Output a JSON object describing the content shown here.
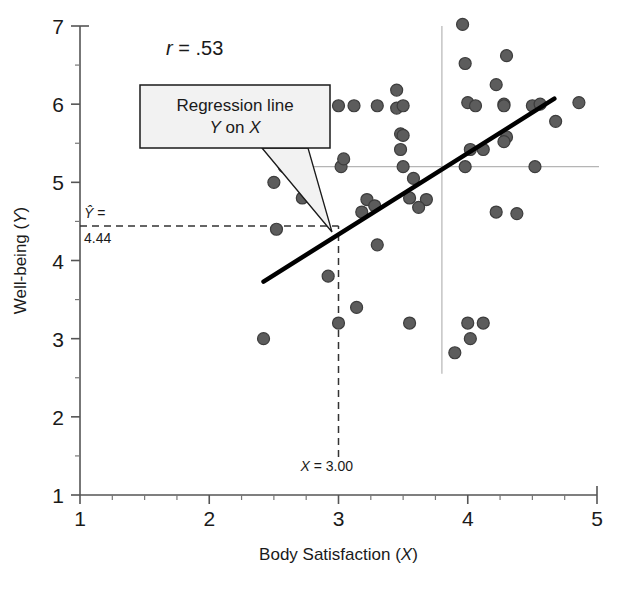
{
  "chart_data": {
    "type": "scatter",
    "title": "",
    "xlabel": "Body Satisfaction (X)",
    "ylabel": "Well-being (Y)",
    "xlabel_main": "Body Satisfaction",
    "xlabel_var": "X",
    "ylabel_main": "Well-being",
    "ylabel_var": "Y",
    "xlim": [
      1,
      5
    ],
    "ylim": [
      1,
      7
    ],
    "xticks": [
      1,
      2,
      3,
      4,
      5
    ],
    "xtick_labels": [
      "1",
      "2",
      "3",
      "4",
      "5"
    ],
    "yticks": [
      1,
      2,
      3,
      4,
      5,
      6,
      7
    ],
    "ytick_labels": [
      "1",
      "2",
      "3",
      "4",
      "5",
      "6",
      "7"
    ],
    "x_minor_ticks": [
      1.25,
      1.5,
      1.75,
      2.25,
      2.5,
      2.75,
      3.25,
      3.5,
      3.75,
      4.25,
      4.5,
      4.75
    ],
    "y_minor_ticks": [
      1.5,
      2.5,
      3.5,
      4.5,
      5.5,
      6.5
    ],
    "grid": false,
    "legend": "none",
    "correlation_label": "r = .53",
    "correlation_symbol": "r",
    "correlation_value": "= .53",
    "regression_line": {
      "label_line1": "Regression line",
      "label_line2_var1": "Y",
      "label_line2_mid": " on ",
      "label_line2_var2": "X",
      "label_line2": "Y on X",
      "x_start": 2.42,
      "y_start": 3.73,
      "x_end": 4.67,
      "y_end": 6.07,
      "color": "#000000"
    },
    "reference_lines": {
      "mean_x": 3.8,
      "mean_y": 5.2,
      "color": "#b5b5b5"
    },
    "annotations": [
      {
        "name": "predicted-y",
        "symbol": "Ŷ",
        "equals": "=",
        "value": "4.44",
        "y": 4.44,
        "style": "dashed"
      },
      {
        "name": "given-x",
        "symbol": "X",
        "text": "= 3.00",
        "full_text": "X = 3.00",
        "x": 3.0,
        "style": "dashed"
      }
    ],
    "point_color": "#5c5c5c",
    "point_edge_color": "#3d3d3d",
    "point_radius": 6,
    "points": [
      [
        2.42,
        3.0
      ],
      [
        2.72,
        4.8
      ],
      [
        2.62,
        5.6
      ],
      [
        2.78,
        5.6
      ],
      [
        2.58,
        5.2
      ],
      [
        2.72,
        5.2
      ],
      [
        2.5,
        5.0
      ],
      [
        2.52,
        4.4
      ],
      [
        2.92,
        3.8
      ],
      [
        3.0,
        5.98
      ],
      [
        3.12,
        5.98
      ],
      [
        3.02,
        5.2
      ],
      [
        3.04,
        5.3
      ],
      [
        3.22,
        4.78
      ],
      [
        3.18,
        4.62
      ],
      [
        3.28,
        4.7
      ],
      [
        3.3,
        5.98
      ],
      [
        3.14,
        3.4
      ],
      [
        3.0,
        3.2
      ],
      [
        3.3,
        4.2
      ],
      [
        3.45,
        6.18
      ],
      [
        3.45,
        5.95
      ],
      [
        3.5,
        5.98
      ],
      [
        3.48,
        5.62
      ],
      [
        3.5,
        5.6
      ],
      [
        3.48,
        5.42
      ],
      [
        3.5,
        5.2
      ],
      [
        3.58,
        5.05
      ],
      [
        3.55,
        4.8
      ],
      [
        3.55,
        3.2
      ],
      [
        3.68,
        4.78
      ],
      [
        3.62,
        4.68
      ],
      [
        3.9,
        2.82
      ],
      [
        3.98,
        5.2
      ],
      [
        3.98,
        6.52
      ],
      [
        3.96,
        7.02
      ],
      [
        4.0,
        6.02
      ],
      [
        4.06,
        5.98
      ],
      [
        4.02,
        5.42
      ],
      [
        4.0,
        3.2
      ],
      [
        4.02,
        3.0
      ],
      [
        4.12,
        5.42
      ],
      [
        4.12,
        3.2
      ],
      [
        4.22,
        6.25
      ],
      [
        4.28,
        6.0
      ],
      [
        4.28,
        5.98
      ],
      [
        4.3,
        6.62
      ],
      [
        4.3,
        5.58
      ],
      [
        4.28,
        5.52
      ],
      [
        4.22,
        4.62
      ],
      [
        4.38,
        4.6
      ],
      [
        4.5,
        5.98
      ],
      [
        4.56,
        6.0
      ],
      [
        4.52,
        5.2
      ],
      [
        4.86,
        6.02
      ],
      [
        4.68,
        5.78
      ]
    ]
  },
  "caption": {
    "text": "",
    "partial_line": ""
  }
}
